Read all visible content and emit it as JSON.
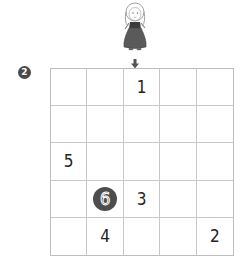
{
  "puzzle": {
    "number_badge": "2",
    "entry_column": 2,
    "grid": {
      "rows": 5,
      "cols": 5,
      "cells": [
        [
          "",
          "",
          "1",
          "",
          ""
        ],
        [
          "",
          "",
          "",
          "",
          ""
        ],
        [
          "5",
          "",
          "",
          "",
          ""
        ],
        [
          "",
          "6",
          "3",
          "",
          ""
        ],
        [
          "",
          "4",
          "",
          "",
          "2"
        ]
      ],
      "highlighted": [
        {
          "row": 3,
          "col": 1,
          "value": "6"
        }
      ]
    }
  },
  "colors": {
    "grid_line": "#c8c8c8",
    "highlight_fill": "#4d4d4d",
    "badge_fill": "#4a4a4a"
  }
}
